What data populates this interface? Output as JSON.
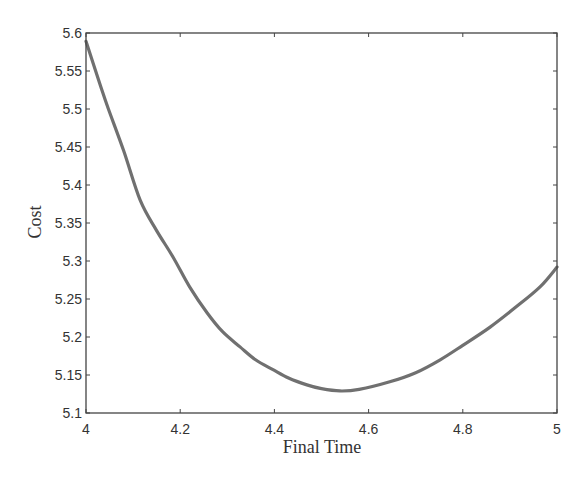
{
  "chart_data": {
    "type": "line",
    "title": "",
    "xlabel": "Final Time",
    "ylabel": "Cost",
    "xlim": [
      4,
      5
    ],
    "ylim": [
      5.1,
      5.6
    ],
    "grid": false,
    "legend": null,
    "xticks": [
      4,
      4.2,
      4.4,
      4.6,
      4.8,
      5
    ],
    "xtick_labels": [
      "4",
      "4.2",
      "4.4",
      "4.6",
      "4.8",
      "5"
    ],
    "yticks": [
      5.1,
      5.15,
      5.2,
      5.25,
      5.3,
      5.35,
      5.4,
      5.45,
      5.5,
      5.55,
      5.6
    ],
    "ytick_labels": [
      "5.1",
      "5.15",
      "5.2",
      "5.25",
      "5.3",
      "5.35",
      "5.4",
      "5.45",
      "5.5",
      "5.55",
      "5.6"
    ],
    "series": [
      {
        "name": "Cost",
        "color": "#707070",
        "x": [
          4.0,
          4.03,
          4.047,
          4.08,
          4.115,
          4.149,
          4.185,
          4.22,
          4.257,
          4.29,
          4.327,
          4.36,
          4.397,
          4.43,
          4.469,
          4.5,
          4.539,
          4.58,
          4.645,
          4.7,
          4.752,
          4.8,
          4.858,
          4.91,
          4.964,
          5.0
        ],
        "y": [
          5.589,
          5.532,
          5.501,
          5.445,
          5.38,
          5.341,
          5.305,
          5.266,
          5.232,
          5.207,
          5.187,
          5.17,
          5.157,
          5.146,
          5.137,
          5.132,
          5.129,
          5.131,
          5.141,
          5.153,
          5.17,
          5.189,
          5.213,
          5.238,
          5.266,
          5.292
        ]
      }
    ]
  },
  "axes": {
    "x_label": "Final Time",
    "y_label": "Cost",
    "axis_color": "#444444",
    "background": "#ffffff"
  }
}
